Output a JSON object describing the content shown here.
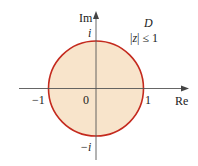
{
  "diagram": {
    "region_label": "D",
    "condition": "|z| ≤ 1",
    "axes": {
      "real_label": "Re",
      "imag_label": "Im"
    },
    "ticks": {
      "origin": "0",
      "real_pos": "1",
      "real_neg": "−1",
      "imag_pos": "i",
      "imag_neg": "−i"
    },
    "colors": {
      "fill": "#f8e4cb",
      "stroke": "#c42a1e",
      "axis": "#555555"
    }
  }
}
